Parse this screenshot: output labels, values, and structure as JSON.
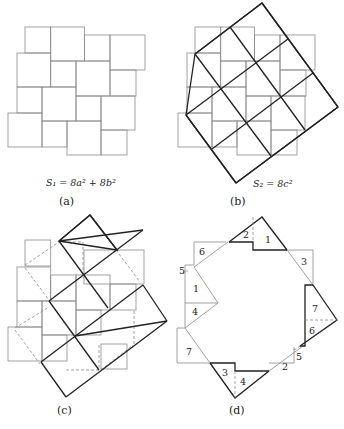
{
  "panels": [
    {
      "id": "a",
      "caption": "(a)",
      "formula": "S₁ = 8a² + 8b²"
    },
    {
      "id": "b",
      "caption": "(b)",
      "formula": "S₂ = 8c²"
    },
    {
      "id": "c",
      "caption": "(c)"
    },
    {
      "id": "d",
      "caption": "(d)",
      "piece_labels": [
        "1",
        "2",
        "3",
        "4",
        "5",
        "6",
        "7",
        "1",
        "2",
        "3",
        "4",
        "5",
        "6",
        "7"
      ]
    }
  ],
  "colors": {
    "thin_line": "#8a8a8a",
    "thick_line": "#222222",
    "background": "#ffffff"
  }
}
